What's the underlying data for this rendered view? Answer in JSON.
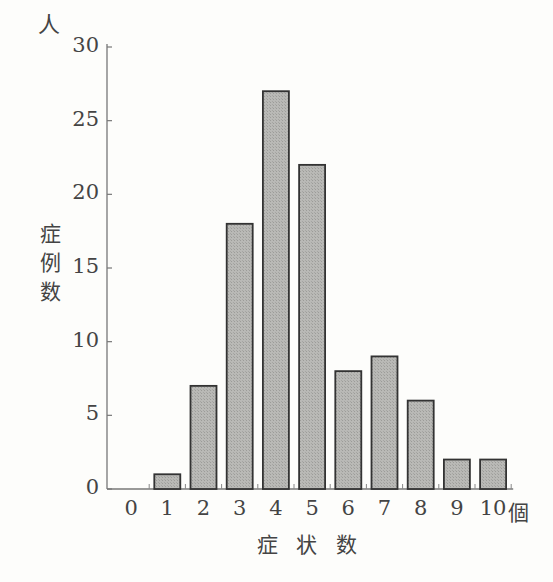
{
  "chart_data": {
    "type": "bar",
    "title": "",
    "xlabel": "症状数",
    "x_unit": "個",
    "ylabel": "症例数",
    "y_unit": "人",
    "categories": [
      "0",
      "1",
      "2",
      "3",
      "4",
      "5",
      "6",
      "7",
      "8",
      "9",
      "10"
    ],
    "values": [
      0,
      1,
      7,
      18,
      27,
      22,
      8,
      9,
      6,
      2,
      2
    ],
    "ylim": [
      0,
      30
    ],
    "yticks": [
      0,
      5,
      10,
      15,
      20,
      25,
      30
    ],
    "grid": false,
    "legend": null,
    "bar_color": "#b4b4b4",
    "bar_edge_color": "#333333"
  },
  "labels": {
    "y_unit": "人",
    "y_title": [
      "症",
      "例",
      "数"
    ],
    "x_unit": "個",
    "x_title": "症 状 数",
    "caption": ""
  }
}
